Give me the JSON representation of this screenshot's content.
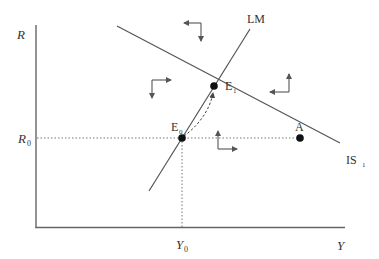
{
  "diagram": {
    "type": "IS-LM diagram",
    "axes": {
      "y_label": "R",
      "x_label": "Y",
      "y_tick_label": "R",
      "y_tick_sub": "0",
      "x_tick_label": "Y",
      "x_tick_sub": "0"
    },
    "curves": {
      "lm": {
        "label": "LM"
      },
      "is": {
        "label": "IS",
        "sub": "1"
      }
    },
    "points": {
      "e0": {
        "label": "E",
        "sub": "0"
      },
      "e1": {
        "label": "E",
        "sub": "1"
      },
      "a": {
        "label": "A"
      }
    },
    "direction_arrows": [
      {
        "position": "top-center",
        "horizontal": "left",
        "vertical": "down"
      },
      {
        "position": "upper-left",
        "horizontal": "right",
        "vertical": "down"
      },
      {
        "position": "upper-right",
        "horizontal": "left",
        "vertical": "up"
      },
      {
        "position": "lower-right-of-E0",
        "horizontal": "right",
        "vertical": "up"
      }
    ],
    "adjustment_path": "dashed curved arrow from E0 to E1",
    "colors": {
      "line": "#555555",
      "text": "#333333",
      "point": "#111111"
    }
  }
}
